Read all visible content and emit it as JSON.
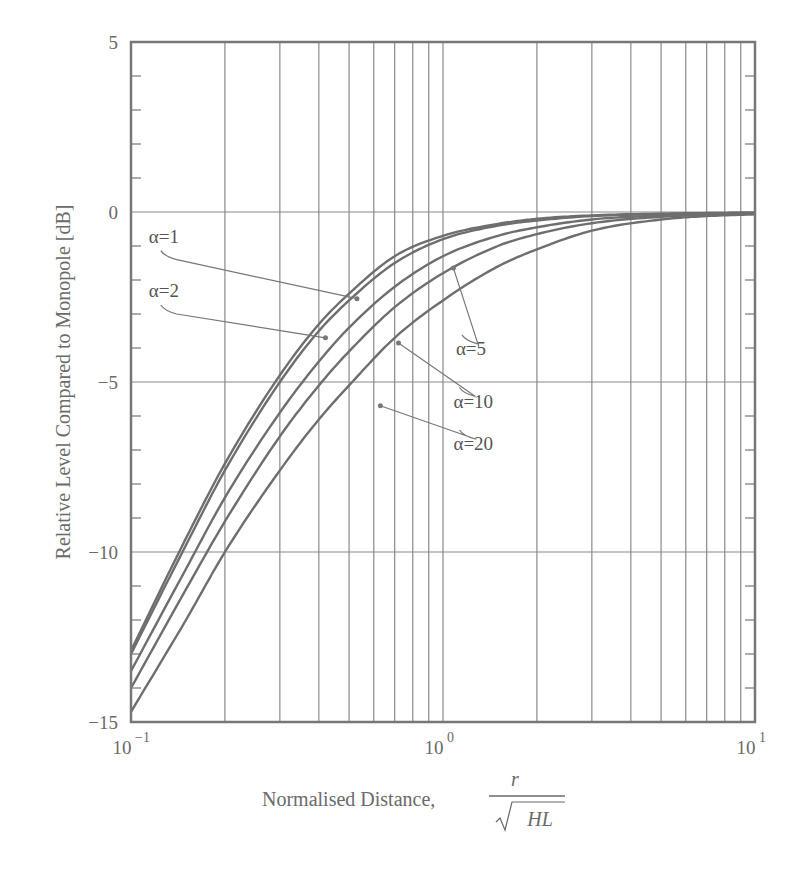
{
  "chart_data": {
    "type": "line",
    "title": "",
    "xlabel": "Normalised Distance, r/√(HL)",
    "xlabel_parts": {
      "text": "Normalised Distance,",
      "numerator": "r",
      "denominator": "HL"
    },
    "ylabel": "Relative Level Compared to Monopole [dB]",
    "xscale": "log",
    "xlim": [
      0.1,
      10
    ],
    "ylim": [
      -15,
      5
    ],
    "grid": true,
    "x_ticks": [
      {
        "value": 0.1,
        "base": "10",
        "exp": "−1"
      },
      {
        "value": 1,
        "base": "10",
        "exp": "0"
      },
      {
        "value": 10,
        "base": "10",
        "exp": "1"
      }
    ],
    "y_ticks": [
      {
        "value": 5,
        "label": "5"
      },
      {
        "value": 0,
        "label": "0"
      },
      {
        "value": -5,
        "label": "−5"
      },
      {
        "value": -10,
        "label": "−10"
      },
      {
        "value": -15,
        "label": "−15"
      }
    ],
    "x": [
      0.1,
      0.15,
      0.2,
      0.3,
      0.4,
      0.5,
      0.7,
      1.0,
      1.5,
      2.0,
      3.0,
      5.0,
      7.0,
      10.0
    ],
    "series": [
      {
        "name": "α=1",
        "values": [
          -12.9,
          -9.6,
          -7.4,
          -4.8,
          -3.3,
          -2.4,
          -1.3,
          -0.7,
          -0.35,
          -0.2,
          -0.1,
          -0.05,
          -0.03,
          -0.02
        ]
      },
      {
        "name": "α=2",
        "values": [
          -13.0,
          -9.8,
          -7.6,
          -5.0,
          -3.5,
          -2.6,
          -1.5,
          -0.8,
          -0.4,
          -0.25,
          -0.12,
          -0.06,
          -0.04,
          -0.02
        ]
      },
      {
        "name": "α=5",
        "values": [
          -13.5,
          -10.5,
          -8.4,
          -5.9,
          -4.4,
          -3.4,
          -2.2,
          -1.3,
          -0.7,
          -0.45,
          -0.22,
          -0.1,
          -0.06,
          -0.04
        ]
      },
      {
        "name": "α=10",
        "values": [
          -14.0,
          -11.1,
          -9.1,
          -6.6,
          -5.1,
          -4.1,
          -2.8,
          -1.8,
          -1.0,
          -0.65,
          -0.33,
          -0.14,
          -0.08,
          -0.05
        ]
      },
      {
        "name": "α=20",
        "values": [
          -14.7,
          -12.0,
          -10.0,
          -7.6,
          -6.1,
          -5.1,
          -3.7,
          -2.6,
          -1.6,
          -1.1,
          -0.55,
          -0.22,
          -0.12,
          -0.07
        ]
      }
    ],
    "annotations": [
      {
        "label": "α=1",
        "text_x": 0.114,
        "text_y": -0.9,
        "point_x": 0.53,
        "point_y": -2.55
      },
      {
        "label": "α=2",
        "text_x": 0.114,
        "text_y": -2.5,
        "point_x": 0.42,
        "point_y": -3.7
      },
      {
        "label": "α=5",
        "text_x": 1.1,
        "text_y": -4.2,
        "point_x": 1.08,
        "point_y": -1.65
      },
      {
        "label": "α=10",
        "text_x": 1.08,
        "text_y": -5.75,
        "point_x": 0.72,
        "point_y": -3.85
      },
      {
        "label": "α=20",
        "text_x": 1.08,
        "text_y": -7.0,
        "point_x": 0.63,
        "point_y": -5.7
      }
    ],
    "colors": {
      "curve": "#6e6e6e",
      "grid": "#8a8a8a",
      "frame": "#777777",
      "text": "#6a6a6a"
    }
  }
}
